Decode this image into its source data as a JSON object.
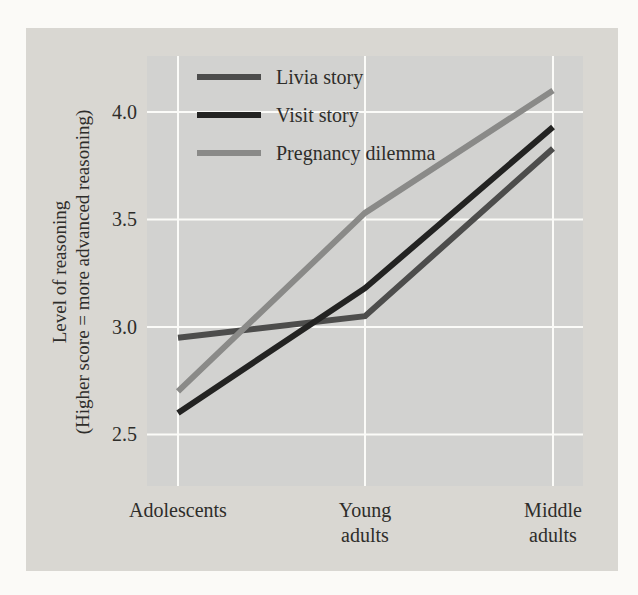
{
  "chart_data": {
    "type": "line",
    "title": "",
    "xlabel": "",
    "ylabel": "Level of reasoning (Higher score = more advanced reasoning)",
    "ylabel_line1": "Level of reasoning",
    "ylabel_line2": "(Higher score = more advanced reasoning)",
    "categories": [
      "Adolescents",
      "Young adults",
      "Middle adults"
    ],
    "category_tick_lines": [
      [
        "Adolescents"
      ],
      [
        "Young",
        "adults"
      ],
      [
        "Middle",
        "adults"
      ]
    ],
    "series": [
      {
        "name": "Livia story",
        "color": "#4d4d4c",
        "values": [
          2.95,
          3.05,
          3.83
        ]
      },
      {
        "name": "Visit story",
        "color": "#232322",
        "values": [
          2.6,
          3.18,
          3.93
        ]
      },
      {
        "name": "Pregnancy dilemma",
        "color": "#8a8a88",
        "values": [
          2.7,
          3.53,
          4.1
        ]
      }
    ],
    "yticks": [
      {
        "value": 4.0,
        "label": "4.0"
      },
      {
        "value": 3.5,
        "label": "3.5"
      },
      {
        "value": 3.0,
        "label": "3.0"
      },
      {
        "value": 2.5,
        "label": "2.5"
      }
    ],
    "ylim": [
      2.26,
      4.26
    ],
    "grid": true,
    "gridline_color": "#fbfbf8",
    "legend_position": "top-left",
    "category_x_fractions": [
      0.0711,
      0.5,
      0.9312
    ],
    "colors": {
      "page_background": "#fbfaf7",
      "panel_background": "#d9d7d2",
      "plot_background": "#d2d2d0",
      "text": "#2e2d2a"
    }
  }
}
